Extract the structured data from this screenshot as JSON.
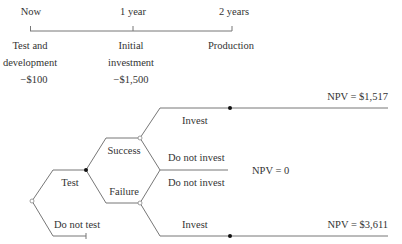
{
  "timeline": {
    "points": [
      {
        "label": "Now",
        "event_lines": [
          "Test and",
          "development",
          "−$100"
        ]
      },
      {
        "label": "1 year",
        "event_lines": [
          "Initial",
          "investment",
          "−$1,500"
        ]
      },
      {
        "label": "2 years",
        "event_lines": [
          "Production"
        ]
      }
    ]
  },
  "tree": {
    "root_branches": {
      "test": "Test",
      "do_not_test": "Do not test"
    },
    "outcomes": {
      "success": "Success",
      "failure": "Failure"
    },
    "decisions": {
      "success_invest": "Invest",
      "success_do_not_invest": "Do not invest",
      "failure_do_not_invest": "Do not invest",
      "failure_invest": "Invest"
    },
    "payoffs": {
      "top": "NPV = $1,517",
      "middle": "NPV = 0",
      "bottom": "NPV = $3,611"
    }
  },
  "colors": {
    "line": "#777777",
    "text": "#333333",
    "node": "#111111"
  }
}
